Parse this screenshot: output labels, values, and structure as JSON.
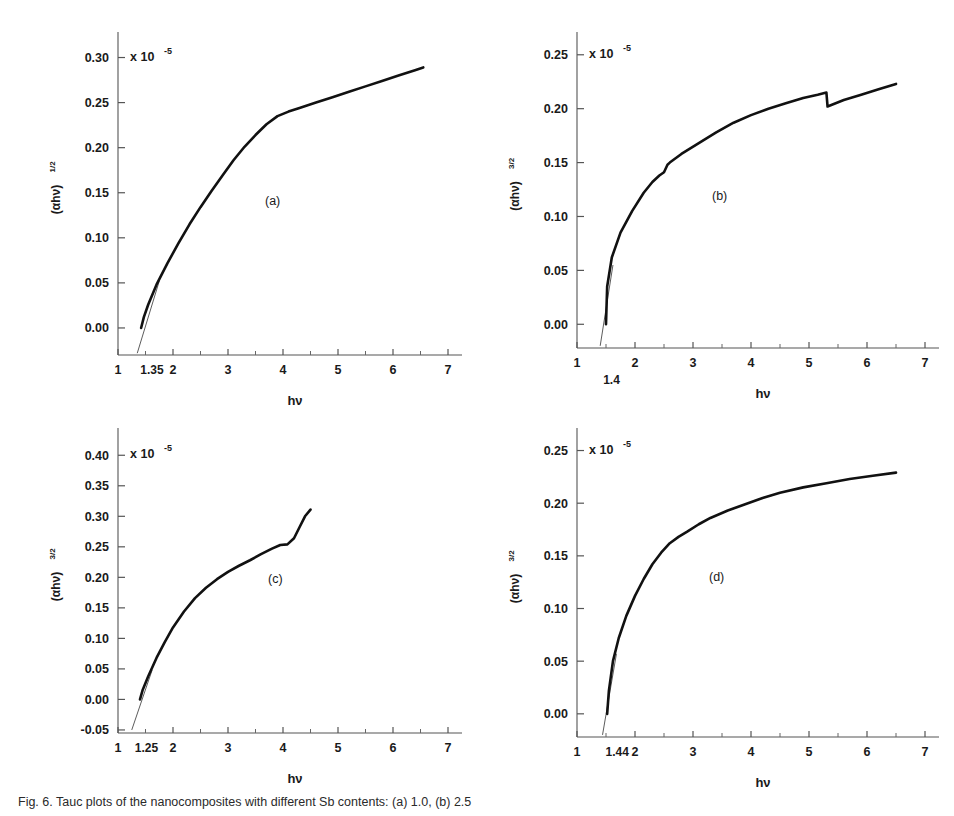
{
  "figure": {
    "caption": "Fig. 6. Tauc plots of the nanocomposites with different Sb contents: (a) 1.0, (b) 2.5",
    "axis_x_title": "hν",
    "multiplier_label": "x 10",
    "multiplier_exponent": "-5"
  },
  "panels": [
    {
      "id": "a",
      "letter": "(a)",
      "ylabel_base": "(αhν)",
      "ylabel_exponent": "1/2",
      "yticks": [
        "0.00",
        "0.05",
        "0.10",
        "0.15",
        "0.20",
        "0.25",
        "0.30"
      ],
      "xticks": [
        "1",
        "2",
        "3",
        "4",
        "5",
        "6",
        "7"
      ],
      "intercept_label": "1.35",
      "intercept_below_axis": false
    },
    {
      "id": "b",
      "letter": "(b)",
      "ylabel_base": "(αhν)",
      "ylabel_exponent": "3/2",
      "yticks": [
        "0.00",
        "0.05",
        "0.10",
        "0.15",
        "0.20",
        "0.25"
      ],
      "xticks": [
        "1",
        "2",
        "3",
        "4",
        "5",
        "6",
        "7"
      ],
      "intercept_label": "1.4",
      "intercept_below_axis": true
    },
    {
      "id": "c",
      "letter": "(c)",
      "ylabel_base": "(αhν)",
      "ylabel_exponent": "3/2",
      "yticks": [
        "-0.05",
        "0.00",
        "0.05",
        "0.10",
        "0.15",
        "0.20",
        "0.25",
        "0.30",
        "0.35",
        "0.40"
      ],
      "xticks": [
        "1",
        "2",
        "3",
        "4",
        "5",
        "6",
        "7"
      ],
      "intercept_label": "1.25",
      "intercept_below_axis": false
    },
    {
      "id": "d",
      "letter": "(d)",
      "ylabel_base": "(αhν)",
      "ylabel_exponent": "3/2",
      "yticks": [
        "0.00",
        "0.05",
        "0.10",
        "0.15",
        "0.20",
        "0.25"
      ],
      "xticks": [
        "1",
        "2",
        "3",
        "4",
        "5",
        "6",
        "7"
      ],
      "intercept_label": "1.44",
      "intercept_below_axis": false
    }
  ],
  "chart_data": [
    {
      "type": "line",
      "panel": "a",
      "title": "(a)",
      "xlabel": "hν",
      "ylabel": "(αhν)^1/2",
      "y_multiplier": "x 10^-5",
      "xlim": [
        1,
        7
      ],
      "ylim": [
        -0.03,
        0.315
      ],
      "xticks": [
        1,
        2,
        3,
        4,
        5,
        6,
        7
      ],
      "yticks": [
        0.0,
        0.05,
        0.1,
        0.15,
        0.2,
        0.25,
        0.3
      ],
      "grid": false,
      "legend": "none",
      "band_gap_intercept": 1.35,
      "x": [
        1.42,
        1.47,
        1.55,
        1.7,
        1.9,
        2.1,
        2.3,
        2.5,
        2.7,
        2.9,
        3.1,
        3.3,
        3.5,
        3.7,
        3.9,
        4.1,
        4.3,
        4.6,
        4.9,
        5.2,
        5.5,
        5.8,
        6.1,
        6.4,
        6.55
      ],
      "y": [
        0.0,
        0.012,
        0.026,
        0.048,
        0.072,
        0.094,
        0.115,
        0.134,
        0.152,
        0.169,
        0.186,
        0.201,
        0.214,
        0.226,
        0.235,
        0.24,
        0.244,
        0.25,
        0.256,
        0.262,
        0.268,
        0.274,
        0.28,
        0.286,
        0.289
      ],
      "fit_line": {
        "x": [
          1.35,
          1.75
        ],
        "y": [
          -0.028,
          0.052
        ]
      }
    },
    {
      "type": "line",
      "panel": "b",
      "title": "(b)",
      "xlabel": "hν",
      "ylabel": "(αhν)^3/2",
      "y_multiplier": "x 10^-5",
      "xlim": [
        1,
        7
      ],
      "ylim": [
        -0.022,
        0.26
      ],
      "xticks": [
        1,
        2,
        3,
        4,
        5,
        6,
        7
      ],
      "yticks": [
        0.0,
        0.05,
        0.1,
        0.15,
        0.2,
        0.25
      ],
      "grid": false,
      "legend": "none",
      "band_gap_intercept": 1.4,
      "x": [
        1.5,
        1.52,
        1.6,
        1.75,
        1.95,
        2.15,
        2.3,
        2.42,
        2.5,
        2.56,
        2.6,
        2.8,
        3.1,
        3.4,
        3.7,
        4.0,
        4.3,
        4.6,
        4.9,
        5.15,
        5.3,
        5.32,
        5.6,
        5.9,
        6.2,
        6.5
      ],
      "y": [
        0.0,
        0.035,
        0.062,
        0.085,
        0.105,
        0.122,
        0.132,
        0.138,
        0.141,
        0.148,
        0.15,
        0.158,
        0.168,
        0.178,
        0.187,
        0.194,
        0.2,
        0.205,
        0.21,
        0.213,
        0.215,
        0.202,
        0.208,
        0.213,
        0.218,
        0.223
      ],
      "fit_line": {
        "x": [
          1.4,
          1.62
        ],
        "y": [
          -0.02,
          0.055
        ]
      },
      "annotations": [
        "kink at hν ≈ 2.5",
        "discontinuity at hν ≈ 5.3"
      ]
    },
    {
      "type": "line",
      "panel": "c",
      "title": "(c)",
      "xlabel": "hν",
      "ylabel": "(αhν)^3/2",
      "y_multiplier": "x 10^-5",
      "xlim": [
        1,
        7
      ],
      "ylim": [
        -0.055,
        0.425
      ],
      "xticks": [
        1,
        2,
        3,
        4,
        5,
        6,
        7
      ],
      "yticks": [
        -0.05,
        0.0,
        0.05,
        0.1,
        0.15,
        0.2,
        0.25,
        0.3,
        0.35,
        0.4
      ],
      "grid": false,
      "legend": "none",
      "band_gap_intercept": 1.25,
      "x": [
        1.4,
        1.45,
        1.55,
        1.7,
        1.85,
        2.0,
        2.2,
        2.4,
        2.6,
        2.8,
        3.0,
        3.2,
        3.4,
        3.6,
        3.8,
        3.95,
        4.08,
        4.2,
        4.3,
        4.4,
        4.5
      ],
      "y": [
        0.0,
        0.016,
        0.038,
        0.068,
        0.094,
        0.118,
        0.144,
        0.166,
        0.183,
        0.197,
        0.209,
        0.219,
        0.228,
        0.238,
        0.247,
        0.253,
        0.254,
        0.264,
        0.282,
        0.3,
        0.311
      ],
      "fit_line": {
        "x": [
          1.25,
          1.62
        ],
        "y": [
          -0.05,
          0.048
        ]
      }
    },
    {
      "type": "line",
      "panel": "d",
      "title": "(d)",
      "xlabel": "hν",
      "ylabel": "(αhν)^3/2",
      "y_multiplier": "x 10^-5",
      "xlim": [
        1,
        7
      ],
      "ylim": [
        -0.022,
        0.26
      ],
      "xticks": [
        1,
        2,
        3,
        4,
        5,
        6,
        7
      ],
      "yticks": [
        0.0,
        0.05,
        0.1,
        0.15,
        0.2,
        0.25
      ],
      "grid": false,
      "legend": "none",
      "band_gap_intercept": 1.44,
      "x": [
        1.52,
        1.55,
        1.62,
        1.72,
        1.85,
        2.0,
        2.15,
        2.3,
        2.45,
        2.6,
        2.75,
        2.9,
        3.1,
        3.3,
        3.6,
        3.9,
        4.2,
        4.5,
        4.9,
        5.3,
        5.7,
        6.1,
        6.5
      ],
      "y": [
        0.0,
        0.022,
        0.05,
        0.072,
        0.093,
        0.112,
        0.128,
        0.142,
        0.153,
        0.162,
        0.168,
        0.173,
        0.18,
        0.186,
        0.193,
        0.199,
        0.205,
        0.21,
        0.215,
        0.219,
        0.223,
        0.226,
        0.229
      ],
      "fit_line": {
        "x": [
          1.44,
          1.68
        ],
        "y": [
          -0.02,
          0.057
        ]
      }
    }
  ]
}
